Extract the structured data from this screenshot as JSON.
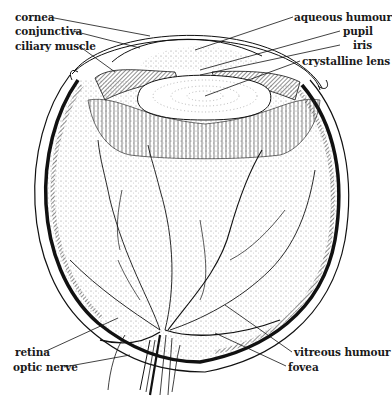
{
  "diagram": {
    "colors": {
      "ink": "#111111",
      "background": "#ffffff",
      "stipple": "#777777"
    },
    "labels": {
      "cornea": "cornea",
      "conjunctiva": "conjunctiva",
      "ciliary_muscle": "ciliary muscle",
      "aqueous_humour": "aqueous humour",
      "pupil": "pupil",
      "iris": "iris",
      "crystalline_lens": "crystalline lens",
      "retina": "retina",
      "optic_nerve": "optic nerve",
      "vitreous_humour": "vitreous humour",
      "fovea": "fovea"
    }
  }
}
